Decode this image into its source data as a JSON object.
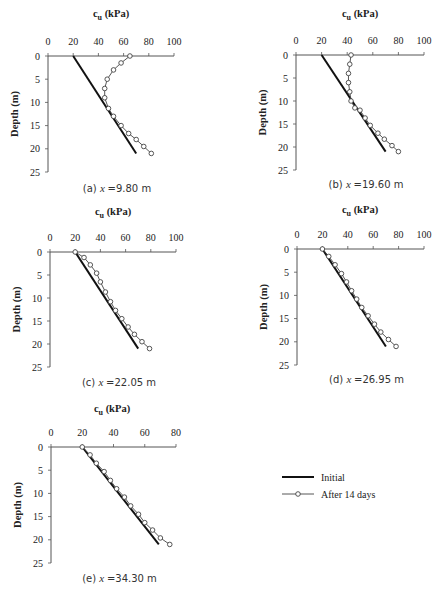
{
  "legend": {
    "items": [
      {
        "label": "Initial",
        "style": "solid-line"
      },
      {
        "label": "After 14 days",
        "style": "line-with-circle-markers"
      }
    ]
  },
  "chart_data": [
    {
      "type": "line",
      "panel": "(a)",
      "caption": "(a) x = 9.80 m",
      "caption_prefix": "(a)",
      "caption_var": "x",
      "caption_value": "=9.80 m",
      "xlabel": "c_u (kPa)",
      "ylabel": "Depth (m)",
      "xlim": [
        0,
        100
      ],
      "ylim": [
        25,
        0
      ],
      "xticks": [
        0,
        20,
        40,
        60,
        80,
        100
      ],
      "yticks": [
        0,
        5,
        10,
        15,
        20,
        25
      ],
      "series": [
        {
          "name": "Initial",
          "x": [
            20,
            70
          ],
          "y": [
            0,
            21
          ]
        },
        {
          "name": "After 14 days",
          "x": [
            65,
            58,
            52,
            47,
            45,
            45,
            48,
            52,
            58,
            64,
            70,
            76,
            82
          ],
          "y": [
            0,
            1.5,
            3,
            5,
            7,
            9,
            11.3,
            13,
            15,
            16.7,
            18,
            19.5,
            21
          ]
        }
      ]
    },
    {
      "type": "line",
      "panel": "(b)",
      "caption": "(b) x = 19.60 m",
      "caption_prefix": "(b)",
      "caption_var": "x",
      "caption_value": "=19.60 m",
      "xlabel": "c_u (kPa)",
      "ylabel": "Depth (m)",
      "xlim": [
        0,
        100
      ],
      "ylim": [
        25,
        0
      ],
      "xticks": [
        0,
        20,
        40,
        60,
        80,
        100
      ],
      "yticks": [
        0,
        5,
        10,
        15,
        20,
        25
      ],
      "series": [
        {
          "name": "Initial",
          "x": [
            20,
            70
          ],
          "y": [
            0,
            21
          ]
        },
        {
          "name": "After 14 days",
          "x": [
            43,
            42,
            41,
            41,
            42,
            43,
            46,
            50,
            54,
            58,
            64,
            69,
            75,
            80
          ],
          "y": [
            0,
            2,
            4,
            6,
            8,
            10,
            11.5,
            12,
            13.7,
            15.3,
            17,
            18.3,
            19.7,
            21
          ]
        }
      ]
    },
    {
      "type": "line",
      "panel": "(c)",
      "caption": "(c) x = 22.05 m",
      "caption_prefix": "(c)",
      "caption_var": "x",
      "caption_value": "=22.05 m",
      "xlabel": "c_u (kPa)",
      "ylabel": "Depth (m)",
      "xlim": [
        0,
        100
      ],
      "ylim": [
        25,
        0
      ],
      "xticks": [
        0,
        20,
        40,
        60,
        80,
        100
      ],
      "yticks": [
        0,
        5,
        10,
        15,
        20,
        25
      ],
      "series": [
        {
          "name": "Initial",
          "x": [
            20,
            70
          ],
          "y": [
            0,
            21
          ]
        },
        {
          "name": "After 14 days",
          "x": [
            20,
            27,
            32,
            37,
            40,
            44,
            48,
            52,
            57,
            62,
            67,
            73,
            79
          ],
          "y": [
            0,
            1.2,
            2.8,
            4.6,
            6.5,
            8.7,
            10.8,
            12.7,
            14.5,
            16.3,
            17.9,
            19.5,
            21
          ]
        }
      ]
    },
    {
      "type": "line",
      "panel": "(d)",
      "caption": "(d) x = 26.95 m",
      "caption_prefix": "(d)",
      "caption_var": "x",
      "caption_value": "=26.95 m",
      "xlabel": "c_u (kPa)",
      "ylabel": "Depth (m)",
      "xlim": [
        0,
        100
      ],
      "ylim": [
        25,
        0
      ],
      "xticks": [
        0,
        20,
        40,
        60,
        80,
        100
      ],
      "yticks": [
        0,
        5,
        10,
        15,
        20,
        25
      ],
      "series": [
        {
          "name": "Initial",
          "x": [
            20,
            70
          ],
          "y": [
            0,
            21
          ]
        },
        {
          "name": "After 14 days",
          "x": [
            20,
            25,
            30,
            35,
            39,
            43,
            47,
            51,
            56,
            61,
            66,
            72,
            78
          ],
          "y": [
            0,
            1.6,
            3.4,
            5.3,
            7.1,
            9,
            10.8,
            12.6,
            14.4,
            16.2,
            17.9,
            19.5,
            21
          ]
        }
      ]
    },
    {
      "type": "line",
      "panel": "(e)",
      "caption": "(e) x = 34.30 m",
      "caption_prefix": "(e)",
      "caption_var": "x",
      "caption_value": "=34.30 m",
      "xlabel": "c_u (kPa)",
      "ylabel": "Depth (m)",
      "xlim": [
        0,
        80
      ],
      "ylim": [
        25,
        0
      ],
      "xticks": [
        0,
        20,
        40,
        60,
        80
      ],
      "yticks": [
        0,
        5,
        10,
        15,
        20,
        25
      ],
      "series": [
        {
          "name": "Initial",
          "x": [
            20,
            69
          ],
          "y": [
            0,
            21
          ]
        },
        {
          "name": "After 14 days",
          "x": [
            20,
            25,
            29,
            34,
            38,
            42,
            47,
            51,
            56,
            60,
            65,
            70,
            76
          ],
          "y": [
            0,
            1.7,
            3.5,
            5.3,
            7.2,
            9,
            10.8,
            12.7,
            14.5,
            16.3,
            17.9,
            19.6,
            21
          ]
        }
      ]
    }
  ],
  "layout": {
    "panels": [
      {
        "x0": 48,
        "x1": 174,
        "y0": 56,
        "y1": 172,
        "title_x": 111,
        "title_y": 17,
        "caption_y": 192
      },
      {
        "x0": 296,
        "x1": 424,
        "y0": 55,
        "y1": 170,
        "title_x": 360,
        "title_y": 17,
        "caption_y": 188
      },
      {
        "x0": 50,
        "x1": 176,
        "y0": 252,
        "y1": 367,
        "title_x": 113,
        "title_y": 215,
        "caption_y": 386
      },
      {
        "x0": 297,
        "x1": 424,
        "y0": 249,
        "y1": 365,
        "title_x": 360,
        "title_y": 213,
        "caption_y": 383
      },
      {
        "x0": 51,
        "x1": 176,
        "y0": 447,
        "y1": 563,
        "title_x": 112,
        "title_y": 412,
        "caption_y": 582
      }
    ],
    "legend": {
      "x": 282,
      "y": 477
    }
  }
}
